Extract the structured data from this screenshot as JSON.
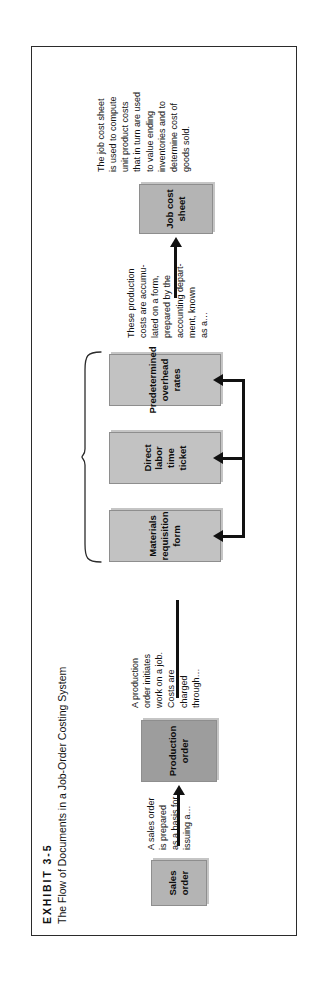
{
  "exhibit": {
    "label": "EXHIBIT 3-5",
    "subtitle": "The Flow of Documents in a Job-Order Costing System"
  },
  "colors": {
    "box_dark": "#9d9d9d",
    "box_mid": "#b4b4b4",
    "box_light": "#c2c2c2",
    "frame_border": "#2b2b2b",
    "arrow": "#111111",
    "page_background": "#ffffff"
  },
  "diagram": {
    "type": "flowchart",
    "orientation": "rotated-90-ccw",
    "boxes": [
      {
        "id": "sales-order",
        "lines": [
          "Sales",
          "order"
        ],
        "tone": "box_mid"
      },
      {
        "id": "production-order",
        "lines": [
          "Production",
          "order"
        ],
        "tone": "box_dark"
      },
      {
        "id": "materials-requisition-form",
        "lines": [
          "Materials",
          "requisition",
          "form"
        ],
        "tone": "box_light"
      },
      {
        "id": "direct-labor-time-ticket",
        "lines": [
          "Direct labor",
          "time ticket"
        ],
        "tone": "box_light"
      },
      {
        "id": "predetermined-overhead-rates",
        "lines": [
          "Predetermined",
          "overhead",
          "rates"
        ],
        "tone": "box_light"
      },
      {
        "id": "job-cost-sheet",
        "lines": [
          "Job cost",
          "sheet"
        ],
        "tone": "box_mid"
      }
    ],
    "notes": [
      {
        "id": "sales-order-note",
        "lines": [
          "A sales order",
          "is prepared",
          "as a basis for",
          "issuing a…"
        ]
      },
      {
        "id": "production-order-note",
        "lines": [
          "A production",
          "order initiates",
          "work on a job.",
          "Costs are",
          "charged",
          "through…"
        ]
      },
      {
        "id": "accumulation-note",
        "lines": [
          "These production",
          "costs are accumu-",
          "lated on a form,",
          "prepared by the",
          "accounting depart-",
          "ment, known",
          "as a…"
        ]
      },
      {
        "id": "job-cost-sheet-note",
        "lines": [
          "The job cost sheet",
          "is used to compute",
          "unit product costs",
          "that in turn are used",
          "to value ending",
          "inventories and to",
          "determine cost of",
          "goods sold."
        ]
      }
    ],
    "connections": [
      {
        "from": "sales-order",
        "to": "production-order",
        "style": "arrow"
      },
      {
        "from": "production-order",
        "to": "materials-requisition-form",
        "style": "arrow"
      },
      {
        "from": "production-order",
        "to": "direct-labor-time-ticket",
        "style": "arrow"
      },
      {
        "from": "production-order",
        "to": "predetermined-overhead-rates",
        "style": "arrow"
      },
      {
        "from": "three-documents-brace",
        "to": "job-cost-sheet",
        "style": "arrow"
      }
    ]
  }
}
